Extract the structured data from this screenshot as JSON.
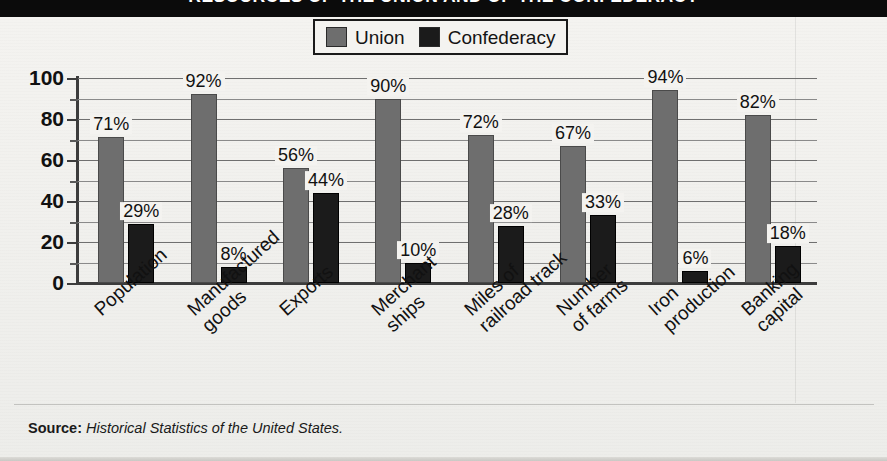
{
  "title": "RESOURCES OF THE UNION AND OF THE CONFEDERACY",
  "legend": {
    "union_label": "Union",
    "confederacy_label": "Confederacy",
    "union_color": "#6e6e6e",
    "confederacy_color": "#1b1b1b"
  },
  "source": {
    "prefix": "Source:",
    "text": "Historical Statistics of the United States."
  },
  "chart_data": {
    "type": "bar",
    "title": "RESOURCES OF THE UNION AND OF THE CONFEDERACY",
    "xlabel": "",
    "ylabel": "",
    "ylim": [
      0,
      100
    ],
    "yticks": [
      0,
      20,
      40,
      60,
      80,
      100
    ],
    "yticks_minor": [
      10,
      30,
      50,
      70,
      90
    ],
    "ytick_labels": [
      "0",
      "20",
      "40",
      "60",
      "80",
      "100"
    ],
    "grid": true,
    "legend_position": "top-center",
    "value_suffix": "%",
    "categories": [
      "Population",
      "Manufactured goods",
      "Exports",
      "Merchant ships",
      "Miles of railroad track",
      "Number of farms",
      "Iron production",
      "Banking capital"
    ],
    "category_lines": [
      [
        "Population"
      ],
      [
        "Manufactured",
        "goods"
      ],
      [
        "Exports"
      ],
      [
        "Merchant",
        "ships"
      ],
      [
        "Miles of",
        "railroad track"
      ],
      [
        "Number",
        "of farms"
      ],
      [
        "Iron",
        "production"
      ],
      [
        "Banking",
        "capital"
      ]
    ],
    "series": [
      {
        "name": "Union",
        "color": "#6e6e6e",
        "values": [
          71,
          92,
          56,
          90,
          72,
          67,
          94,
          82
        ],
        "labels": [
          "71%",
          "92%",
          "56%",
          "90%",
          "72%",
          "67%",
          "94%",
          "82%"
        ]
      },
      {
        "name": "Confederacy",
        "color": "#1b1b1b",
        "values": [
          29,
          8,
          44,
          10,
          28,
          33,
          6,
          18
        ],
        "labels": [
          "29%",
          "8%",
          "44%",
          "10%",
          "28%",
          "33%",
          "6%",
          "18%"
        ]
      }
    ]
  }
}
